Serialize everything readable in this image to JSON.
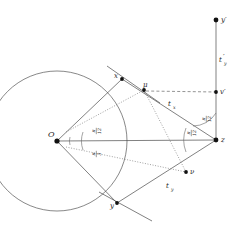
{
  "figure": {
    "background_color": "#ffffff",
    "line_color": "#4a4a4a",
    "point_color": "#111111"
  },
  "points": [
    {
      "id": "O",
      "label": "O",
      "x": 57,
      "y": 141,
      "label_dx": -9,
      "label_dy": -4
    },
    {
      "id": "x",
      "label": "x",
      "x": 122,
      "y": 79,
      "label_dx": -8,
      "label_dy": -1
    },
    {
      "id": "y",
      "label": "y",
      "x": 117,
      "y": 203,
      "label_dx": -7,
      "label_dy": 5
    },
    {
      "id": "mu",
      "label": "μ",
      "x": 144,
      "y": 90,
      "label_dx": -1,
      "label_dy": -3
    },
    {
      "id": "nu",
      "label": "ν",
      "x": 186,
      "y": 172,
      "label_dx": 4,
      "label_dy": 2
    },
    {
      "id": "z",
      "label": "z",
      "x": 216,
      "y": 140,
      "label_dx": 5,
      "label_dy": 2
    },
    {
      "id": "vprime",
      "label": "v′",
      "x": 216,
      "y": 92,
      "label_dx": 4,
      "label_dy": 2
    },
    {
      "id": "yprime",
      "label": "y′",
      "x": 216,
      "y": 20,
      "label_dx": 5,
      "label_dy": 2
    }
  ],
  "segment_labels": [
    {
      "id": "t_x",
      "base": "t",
      "sub": "x",
      "prime": false,
      "x": 172,
      "y": 104
    },
    {
      "id": "t_y",
      "base": "t",
      "sub": "y",
      "prime": false,
      "x": 170,
      "y": 186
    },
    {
      "id": "t_y_prime",
      "base": "t",
      "sub": "y",
      "prime": true,
      "x": 222,
      "y": 61
    }
  ],
  "angle_labels": [
    {
      "id": "angle-O-upper",
      "numerator": "π",
      "denominator": "12",
      "x": 98,
      "y": 131
    },
    {
      "id": "angle-O-lower",
      "numerator": "π",
      "denominator": "3",
      "x": 98,
      "y": 152
    },
    {
      "id": "angle-z-upper",
      "numerator": "π",
      "denominator": "12",
      "x": 206,
      "y": 119
    },
    {
      "id": "angle-z-lower",
      "numerator": "π",
      "denominator": "12",
      "x": 193,
      "y": 134
    }
  ],
  "circle": {
    "id": "main-circle",
    "center_x": 57,
    "center_y": 141,
    "radius": 70
  }
}
